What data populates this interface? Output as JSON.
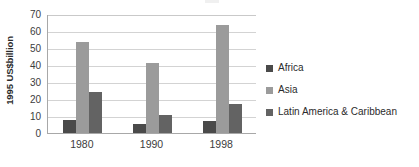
{
  "chart_data": {
    "type": "bar",
    "title": "",
    "xlabel": "",
    "ylabel": "1995 US$billion",
    "categories": [
      "1980",
      "1990",
      "1998"
    ],
    "series": [
      {
        "name": "Africa",
        "values": [
          7.8,
          5.5,
          7.3
        ],
        "color": "#4a4a4a"
      },
      {
        "name": "Asia",
        "values": [
          53.7,
          41.4,
          63.8
        ],
        "color": "#9b9b9b"
      },
      {
        "name": "Latin America & Caribbean",
        "values": [
          24.0,
          10.4,
          17.2
        ],
        "color": "#636363"
      }
    ],
    "ylim": [
      0,
      70
    ],
    "yticks": [
      70,
      60,
      50,
      40,
      30,
      20,
      10,
      0
    ],
    "ytick_labels": [
      "70",
      "60",
      "50",
      "40",
      "30",
      "20",
      "10",
      "0"
    ],
    "grid": true,
    "grid_axis": "y",
    "legend_position": "right",
    "bar_gap_within_group": 0,
    "background_color": "#ffffff",
    "axis_color": "#a8a8a8",
    "grid_color": "#d3d3d3"
  },
  "legend": {
    "items": [
      {
        "label": "Africa",
        "color": "#4a4a4a"
      },
      {
        "label": "Asia",
        "color": "#9b9b9b"
      },
      {
        "label": "Latin America & Caribbean",
        "color": "#636363"
      }
    ]
  }
}
